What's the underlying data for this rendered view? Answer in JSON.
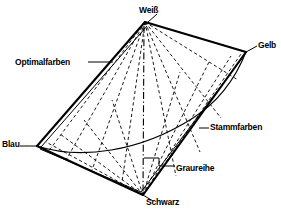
{
  "figure": {
    "background_color": "#ffffff",
    "line_color": "#000000",
    "width": 281,
    "height": 217
  },
  "vertices": [
    {
      "key": "weiss",
      "label": "Weiß",
      "x": 145,
      "y": 22,
      "role": "top-apex"
    },
    {
      "key": "gelb",
      "label": "Gelb",
      "x": 246,
      "y": 52,
      "role": "right-vertex"
    },
    {
      "key": "blau",
      "label": "Blau",
      "x": 37,
      "y": 146,
      "role": "left-vertex"
    },
    {
      "key": "schwarz",
      "label": "Schwarz",
      "x": 143,
      "y": 195,
      "role": "bottom-apex"
    }
  ],
  "annotations": [
    {
      "key": "optimalfarben",
      "label": "Optimalfarben",
      "leader_from_x": 88,
      "leader_from_y": 62,
      "leader_to_x": 113,
      "leader_to_y": 62
    },
    {
      "key": "stammfarben",
      "label": "Stammfarben",
      "leader_from_x": 199,
      "leader_from_y": 128,
      "leader_to_x": 209,
      "leader_to_y": 128
    },
    {
      "key": "graureihe",
      "label": "Graureihe",
      "leader_from_x": 144,
      "leader_from_y": 158,
      "leader_to_x": 175,
      "leader_to_y": 165
    }
  ],
  "legend_meaning": {
    "weiss": "Weiß",
    "schwarz": "Schwarz",
    "blau": "Blau",
    "gelb": "Gelb",
    "graureihe": "Graureihe",
    "stammfarben": "Stammfarben",
    "optimalfarben": "Optimalfarben"
  }
}
